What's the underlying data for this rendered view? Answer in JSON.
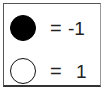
{
  "legend": {
    "items": [
      {
        "symbol": "filled-circle",
        "fill": "#000000",
        "equals": "=",
        "value": "-1"
      },
      {
        "symbol": "open-circle",
        "fill": "#ffffff",
        "equals": "=",
        "value": "1"
      }
    ]
  }
}
